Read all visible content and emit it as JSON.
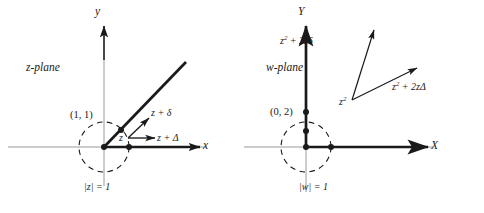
{
  "figure": {
    "background": "#ffffff",
    "ink": "#1a1a1a",
    "axis_gray": "#8a8a8a",
    "width": 484,
    "height": 213
  },
  "left_panel": {
    "name": "z-plane",
    "plane_label": "z-plane",
    "axis_x_label": "x",
    "axis_y_label": "y",
    "point_label": "(1, 1)",
    "unit_circle_label": "|z| = 1",
    "vector_origin_label": "z",
    "vector_labels": [
      "z + δ",
      "z + Δ"
    ],
    "ray_description": "heavy ray from origin through (1,1) at 45 degrees",
    "positive_axis_description": "heavy segment along positive x axis"
  },
  "right_panel": {
    "name": "w-plane",
    "plane_label": "w-plane",
    "axis_x_label": "X",
    "axis_y_label": "Y",
    "point_label": "(0, 2)",
    "unit_circle_label": "|w| = 1",
    "vector_origin_label": "z²",
    "vector_origin_base": "z",
    "vector_origin_exponent": "2",
    "vector_labels": [
      {
        "base": "z",
        "exponent": "2",
        "rest": " + 2zδ",
        "full": "z² + 2zδ"
      },
      {
        "base": "z",
        "exponent": "2",
        "rest": " + 2zΔ",
        "full": "z² + 2zΔ"
      }
    ],
    "ray_description": "heavy ray from origin up the positive Y axis",
    "positive_axis_description": "heavy segment along positive X axis"
  }
}
